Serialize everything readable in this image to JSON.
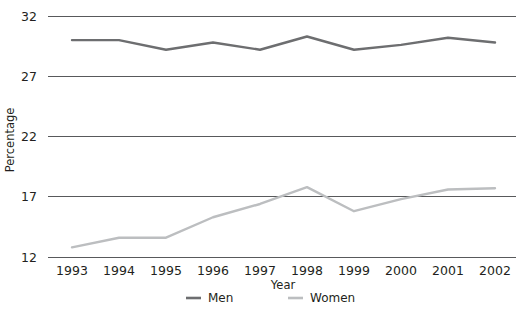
{
  "chart_data": {
    "type": "line",
    "title": "",
    "xlabel": "Year",
    "ylabel": "Percentage",
    "categories": [
      "1993",
      "1994",
      "1995",
      "1996",
      "1997",
      "1998",
      "1999",
      "2000",
      "2001",
      "2002"
    ],
    "x": [
      1993,
      1994,
      1995,
      1996,
      1997,
      1998,
      1999,
      2000,
      2001,
      2002
    ],
    "series": [
      {
        "name": "Men",
        "color": "#6d6e70",
        "values": [
          30.0,
          30.0,
          29.2,
          29.8,
          29.2,
          30.3,
          29.2,
          29.6,
          30.2,
          29.8
        ]
      },
      {
        "name": "Women",
        "color": "#bcbec0",
        "values": [
          12.8,
          13.6,
          13.6,
          15.3,
          16.4,
          17.8,
          15.8,
          16.8,
          17.6,
          17.7
        ]
      }
    ],
    "ylim": [
      12,
      32
    ],
    "yticks": [
      12,
      17,
      22,
      27,
      32
    ],
    "ytick_labels": [
      "12",
      "17",
      "22",
      "27",
      "32"
    ],
    "grid": true,
    "grid_axis": "y",
    "legend_position": "bottom",
    "legend_entries": [
      {
        "label": "Men",
        "color": "#6d6e70"
      },
      {
        "label": "Women",
        "color": "#bcbec0"
      }
    ]
  },
  "layout": {
    "plot_left": 48,
    "plot_right": 516,
    "plot_top": 16,
    "plot_bottom": 257,
    "first_x": 72,
    "x_step": 47,
    "legend_y": 302,
    "legend_men_swatch_x": 186,
    "legend_men_text_x": 208,
    "legend_women_swatch_x": 288,
    "legend_women_text_x": 310,
    "xlabel_x": 283,
    "xlabel_y": 289,
    "ylabel_x": 14,
    "ylabel_y": 140
  }
}
